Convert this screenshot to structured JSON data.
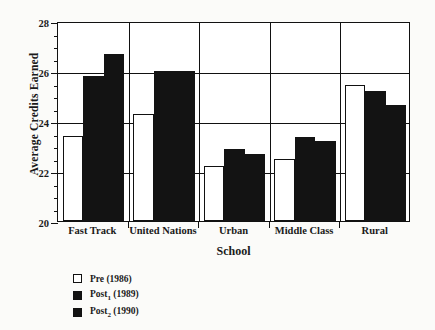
{
  "chart_data": {
    "type": "bar",
    "title": "",
    "xlabel": "School",
    "ylabel": "Average Credits Earned",
    "ylim": [
      20,
      28
    ],
    "yticks": [
      20,
      22,
      24,
      26,
      28
    ],
    "ytick_labels": [
      "20",
      "22",
      "24",
      "26",
      "28"
    ],
    "minor_tick_step": 0.5,
    "grid": "horizontal gridlines at 22, 24, 26 plus vertical separators between category groups",
    "legend_position": "below axes, lower left",
    "categories": [
      "Fast Track",
      "United Nations",
      "Urban",
      "Middle Class",
      "Rural"
    ],
    "series": [
      {
        "name": "Pre (1986)",
        "color": "#ffffff",
        "values": [
          23.4,
          24.3,
          22.2,
          22.5,
          25.45
        ]
      },
      {
        "name": "Post1 (1989)",
        "color": "#131313",
        "values": [
          25.8,
          26.0,
          22.9,
          23.35,
          25.2
        ]
      },
      {
        "name": "Post2 (1990)",
        "color": "#131313",
        "values": [
          26.7,
          26.0,
          22.7,
          23.2,
          24.65
        ]
      }
    ]
  },
  "legend": {
    "items": [
      {
        "label_main": "Pre",
        "sub": "",
        "label_year": " (1986)",
        "swatch": "pre"
      },
      {
        "label_main": "Post",
        "sub": "1",
        "label_year": " (1989)",
        "swatch": "post1"
      },
      {
        "label_main": "Post",
        "sub": "2",
        "label_year": " (1990)",
        "swatch": "post2"
      }
    ]
  }
}
